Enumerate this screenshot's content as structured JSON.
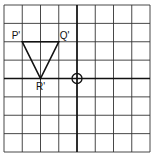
{
  "diagram": {
    "type": "coordinate-grid",
    "grid": {
      "columns": 8,
      "rows": 8
    },
    "axes": {
      "origin_col": 4,
      "origin_row": 4
    },
    "origin_marker": "circle-crosshair",
    "shape": {
      "name": "triangle",
      "vertices": [
        {
          "label": "P'",
          "x": -3,
          "y": 2
        },
        {
          "label": "Q'",
          "x": -1,
          "y": 2
        },
        {
          "label": "R'",
          "x": -2,
          "y": 0
        }
      ]
    },
    "colors": {
      "grid": "#333333",
      "line": "#111111",
      "background": "#ffffff"
    }
  }
}
